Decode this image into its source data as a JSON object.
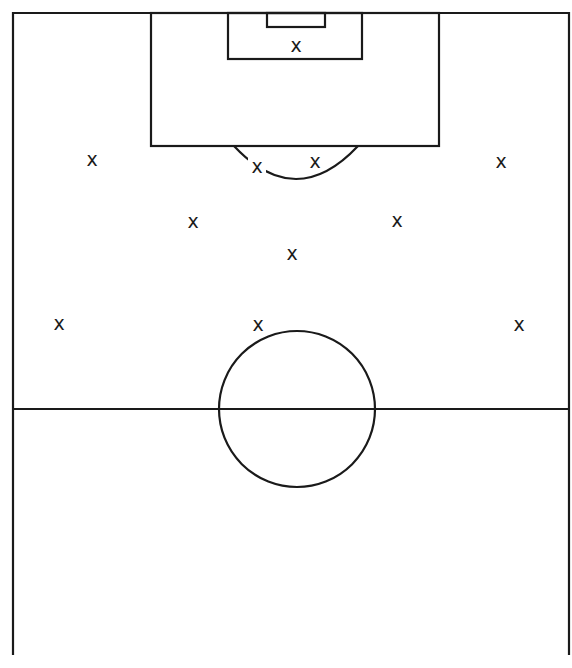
{
  "diagram": {
    "type": "football-pitch-formation",
    "line_color": "#1a1a1a",
    "background_color": "#ffffff",
    "pitch": {
      "outline": {
        "left": 13,
        "top": 13,
        "right": 569,
        "bottom": 655
      },
      "halfway_line_y": 409,
      "center_circle": {
        "cx": 297,
        "cy": 409,
        "r": 78
      },
      "penalty_area": {
        "left": 151,
        "top": 13,
        "right": 439,
        "bottom": 146
      },
      "goal_area": {
        "left": 228,
        "top": 13,
        "right": 362,
        "bottom": 59
      },
      "goal": {
        "left": 267,
        "top": 13,
        "right": 325,
        "bottom": 27
      },
      "penalty_arc": {
        "start_x": 234,
        "end_x": 358,
        "y": 146,
        "lowest_y": 179
      }
    },
    "marker_symbol": "x",
    "players": [
      {
        "id": "goalkeeper",
        "label": "X",
        "x": 296,
        "y": 45
      },
      {
        "id": "left-wide-back",
        "label": "X",
        "x": 92,
        "y": 159
      },
      {
        "id": "left-center-back",
        "label": "X",
        "x": 257,
        "y": 166
      },
      {
        "id": "right-center-back",
        "label": "X",
        "x": 315,
        "y": 161
      },
      {
        "id": "right-wide-back",
        "label": "X",
        "x": 501,
        "y": 161
      },
      {
        "id": "left-midfielder",
        "label": "X",
        "x": 193,
        "y": 221
      },
      {
        "id": "right-midfielder",
        "label": "X",
        "x": 397,
        "y": 220
      },
      {
        "id": "center-midfielder",
        "label": "X",
        "x": 292,
        "y": 253
      },
      {
        "id": "left-forward",
        "label": "X",
        "x": 59,
        "y": 323
      },
      {
        "id": "center-forward",
        "label": "X",
        "x": 258,
        "y": 324
      },
      {
        "id": "right-forward",
        "label": "X",
        "x": 519,
        "y": 324
      }
    ]
  }
}
